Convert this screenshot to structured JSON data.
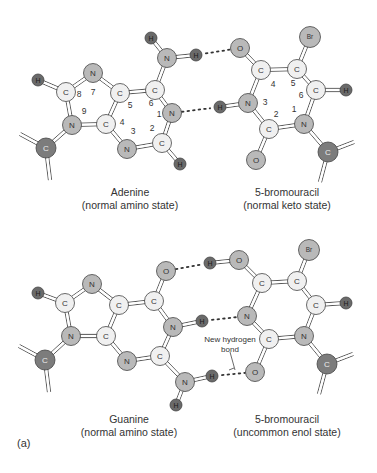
{
  "colors": {
    "carbon": "#f0f0f0",
    "hetero": "#b9b9b9",
    "hydrogen": "#6a6a6a",
    "sugar": "#7c7c7c",
    "bond": "#444444",
    "text": "#333333"
  },
  "top": {
    "left_caption": {
      "name": "Adenine",
      "state": "(normal amino state)"
    },
    "right_caption": {
      "name": "5-bromouracil",
      "state": "(normal keto state)"
    }
  },
  "bottom": {
    "left_caption": {
      "name": "Guanine",
      "state": "(normal amino state)"
    },
    "right_caption": {
      "name": "5-bromouracil",
      "state": "(uncommon enol state)"
    },
    "annotation": {
      "line1": "New hydrogen",
      "line2": "bond"
    }
  },
  "panel_label": "(a)",
  "molecules": [
    {
      "id": "adenine",
      "atoms": [
        {
          "id": "a_H8",
          "el": "H",
          "x": 38,
          "y": 80
        },
        {
          "id": "a_C8",
          "el": "C",
          "x": 66,
          "y": 92
        },
        {
          "id": "a_N7",
          "el": "N",
          "x": 93,
          "y": 73
        },
        {
          "id": "a_C5",
          "el": "C",
          "x": 120,
          "y": 93
        },
        {
          "id": "a_C6",
          "el": "C",
          "x": 155,
          "y": 90
        },
        {
          "id": "a_N6",
          "el": "N",
          "x": 167,
          "y": 58
        },
        {
          "id": "a_H6a",
          "el": "H",
          "x": 151,
          "y": 38
        },
        {
          "id": "a_H6b",
          "el": "H",
          "x": 196,
          "y": 55
        },
        {
          "id": "a_N1",
          "el": "N",
          "x": 172,
          "y": 113
        },
        {
          "id": "a_C2",
          "el": "C",
          "x": 162,
          "y": 143
        },
        {
          "id": "a_H2",
          "el": "H",
          "x": 180,
          "y": 164
        },
        {
          "id": "a_N3",
          "el": "N",
          "x": 127,
          "y": 149
        },
        {
          "id": "a_C4",
          "el": "C",
          "x": 106,
          "y": 124
        },
        {
          "id": "a_N9",
          "el": "N",
          "x": 72,
          "y": 125
        },
        {
          "id": "a_S",
          "el": "C",
          "x": 46,
          "y": 148,
          "sugar": true
        }
      ],
      "numbers": [
        {
          "t": "8",
          "x": 79,
          "y": 97
        },
        {
          "t": "7",
          "x": 93,
          "y": 95
        },
        {
          "t": "9",
          "x": 84,
          "y": 114
        },
        {
          "t": "5",
          "x": 130,
          "y": 108
        },
        {
          "t": "6",
          "x": 151,
          "y": 106
        },
        {
          "t": "1",
          "x": 159,
          "y": 117
        },
        {
          "t": "4",
          "x": 122,
          "y": 125
        },
        {
          "t": "3",
          "x": 133,
          "y": 134
        },
        {
          "t": "2",
          "x": 152,
          "y": 131
        }
      ]
    },
    {
      "id": "bromouracil_keto",
      "atoms": [
        {
          "id": "b_O4",
          "el": "O",
          "x": 240,
          "y": 48
        },
        {
          "id": "b_C4",
          "el": "C",
          "x": 261,
          "y": 70
        },
        {
          "id": "b_C5",
          "el": "C",
          "x": 297,
          "y": 69
        },
        {
          "id": "b_Br",
          "el": "Br",
          "x": 310,
          "y": 37
        },
        {
          "id": "b_C6",
          "el": "C",
          "x": 316,
          "y": 90
        },
        {
          "id": "b_H6",
          "el": "H",
          "x": 346,
          "y": 90
        },
        {
          "id": "b_N3",
          "el": "N",
          "x": 248,
          "y": 103
        },
        {
          "id": "b_H3",
          "el": "H",
          "x": 220,
          "y": 107
        },
        {
          "id": "b_C2",
          "el": "C",
          "x": 269,
          "y": 129
        },
        {
          "id": "b_O2",
          "el": "O",
          "x": 256,
          "y": 160
        },
        {
          "id": "b_N1",
          "el": "N",
          "x": 304,
          "y": 124
        },
        {
          "id": "b_S",
          "el": "C",
          "x": 328,
          "y": 152,
          "sugar": true
        }
      ],
      "numbers": [
        {
          "t": "4",
          "x": 273,
          "y": 87
        },
        {
          "t": "5",
          "x": 293,
          "y": 86
        },
        {
          "t": "6",
          "x": 301,
          "y": 98
        },
        {
          "t": "3",
          "x": 265,
          "y": 105
        },
        {
          "t": "2",
          "x": 276,
          "y": 117
        },
        {
          "t": "1",
          "x": 294,
          "y": 112
        }
      ]
    },
    {
      "id": "guanine",
      "atoms": [
        {
          "id": "g_H8",
          "el": "H",
          "x": 38,
          "y": 293
        },
        {
          "id": "g_C8",
          "el": "C",
          "x": 65,
          "y": 303
        },
        {
          "id": "g_N7",
          "el": "N",
          "x": 92,
          "y": 284
        },
        {
          "id": "g_C5",
          "el": "C",
          "x": 119,
          "y": 305
        },
        {
          "id": "g_C6",
          "el": "C",
          "x": 154,
          "y": 301
        },
        {
          "id": "g_O6",
          "el": "O",
          "x": 166,
          "y": 271
        },
        {
          "id": "g_N1",
          "el": "N",
          "x": 173,
          "y": 327
        },
        {
          "id": "g_H1",
          "el": "H",
          "x": 202,
          "y": 321
        },
        {
          "id": "g_C2",
          "el": "C",
          "x": 160,
          "y": 356
        },
        {
          "id": "g_N2",
          "el": "N",
          "x": 185,
          "y": 382
        },
        {
          "id": "g_H2a",
          "el": "H",
          "x": 212,
          "y": 376
        },
        {
          "id": "g_H2b",
          "el": "H",
          "x": 176,
          "y": 405
        },
        {
          "id": "g_N3",
          "el": "N",
          "x": 127,
          "y": 361
        },
        {
          "id": "g_C4",
          "el": "C",
          "x": 106,
          "y": 336
        },
        {
          "id": "g_N9",
          "el": "N",
          "x": 71,
          "y": 336
        },
        {
          "id": "g_S",
          "el": "C",
          "x": 45,
          "y": 360,
          "sugar": true
        }
      ],
      "numbers": []
    },
    {
      "id": "bromouracil_enol",
      "atoms": [
        {
          "id": "e_H4",
          "el": "H",
          "x": 210,
          "y": 263
        },
        {
          "id": "e_O4",
          "el": "O",
          "x": 239,
          "y": 260
        },
        {
          "id": "e_C4",
          "el": "C",
          "x": 262,
          "y": 283
        },
        {
          "id": "e_C5",
          "el": "C",
          "x": 297,
          "y": 281
        },
        {
          "id": "e_Br",
          "el": "Br",
          "x": 309,
          "y": 250
        },
        {
          "id": "e_C6",
          "el": "C",
          "x": 316,
          "y": 305
        },
        {
          "id": "e_H6",
          "el": "H",
          "x": 346,
          "y": 303
        },
        {
          "id": "e_N3",
          "el": "N",
          "x": 247,
          "y": 316
        },
        {
          "id": "e_C2",
          "el": "C",
          "x": 269,
          "y": 339
        },
        {
          "id": "e_O2",
          "el": "O",
          "x": 255,
          "y": 372
        },
        {
          "id": "e_N1",
          "el": "N",
          "x": 304,
          "y": 336
        },
        {
          "id": "e_S",
          "el": "C",
          "x": 327,
          "y": 364,
          "sugar": true
        }
      ],
      "numbers": []
    }
  ],
  "bonds": [
    [
      "a_H8",
      "a_C8",
      2
    ],
    [
      "a_C8",
      "a_N7",
      2
    ],
    [
      "a_N7",
      "a_C5",
      2
    ],
    [
      "a_C5",
      "a_C6",
      2
    ],
    [
      "a_C6",
      "a_N6",
      2
    ],
    [
      "a_N6",
      "a_H6a",
      2
    ],
    [
      "a_N6",
      "a_H6b",
      2
    ],
    [
      "a_C6",
      "a_N1",
      2
    ],
    [
      "a_N1",
      "a_C2",
      2
    ],
    [
      "a_C2",
      "a_H2",
      2
    ],
    [
      "a_C2",
      "a_N3",
      2
    ],
    [
      "a_N3",
      "a_C4",
      2
    ],
    [
      "a_C4",
      "a_C5",
      2
    ],
    [
      "a_C4",
      "a_N9",
      2
    ],
    [
      "a_N9",
      "a_C8",
      2
    ],
    [
      "a_N9",
      "a_S",
      2
    ],
    [
      "b_O4",
      "b_C4",
      2
    ],
    [
      "b_C4",
      "b_C5",
      2
    ],
    [
      "b_C5",
      "b_Br",
      2
    ],
    [
      "b_C5",
      "b_C6",
      2
    ],
    [
      "b_C6",
      "b_H6",
      2
    ],
    [
      "b_C4",
      "b_N3",
      2
    ],
    [
      "b_N3",
      "b_H3",
      2
    ],
    [
      "b_N3",
      "b_C2",
      2
    ],
    [
      "b_C2",
      "b_O2",
      2
    ],
    [
      "b_C2",
      "b_N1",
      2
    ],
    [
      "b_N1",
      "b_C6",
      2
    ],
    [
      "b_N1",
      "b_S",
      2
    ],
    [
      "g_H8",
      "g_C8",
      2
    ],
    [
      "g_C8",
      "g_N7",
      2
    ],
    [
      "g_N7",
      "g_C5",
      2
    ],
    [
      "g_C5",
      "g_C6",
      2
    ],
    [
      "g_C6",
      "g_O6",
      2
    ],
    [
      "g_C6",
      "g_N1",
      2
    ],
    [
      "g_N1",
      "g_H1",
      2
    ],
    [
      "g_N1",
      "g_C2",
      2
    ],
    [
      "g_C2",
      "g_N2",
      2
    ],
    [
      "g_N2",
      "g_H2a",
      2
    ],
    [
      "g_N2",
      "g_H2b",
      2
    ],
    [
      "g_C2",
      "g_N3",
      2
    ],
    [
      "g_N3",
      "g_C4",
      2
    ],
    [
      "g_C4",
      "g_C5",
      2
    ],
    [
      "g_C4",
      "g_N9",
      2
    ],
    [
      "g_N9",
      "g_C8",
      2
    ],
    [
      "g_N9",
      "g_S",
      2
    ],
    [
      "e_H4",
      "e_O4",
      2
    ],
    [
      "e_O4",
      "e_C4",
      2
    ],
    [
      "e_C4",
      "e_C5",
      2
    ],
    [
      "e_C5",
      "e_Br",
      2
    ],
    [
      "e_C5",
      "e_C6",
      2
    ],
    [
      "e_C6",
      "e_H6",
      2
    ],
    [
      "e_C4",
      "e_N3",
      2
    ],
    [
      "e_N3",
      "e_C2",
      2
    ],
    [
      "e_C2",
      "e_O2",
      2
    ],
    [
      "e_C2",
      "e_N1",
      2
    ],
    [
      "e_N1",
      "e_C6",
      2
    ],
    [
      "e_N1",
      "e_S",
      2
    ]
  ],
  "hbonds": [
    [
      "a_H6b",
      "b_O4"
    ],
    [
      "a_N1",
      "b_H3"
    ],
    [
      "g_O6",
      "e_H4"
    ],
    [
      "g_H1",
      "e_N3"
    ],
    [
      "g_H2a",
      "e_O2"
    ]
  ],
  "sugar_stubs": [
    {
      "from": "a_S",
      "dx": -26,
      "dy": -14
    },
    {
      "from": "a_S",
      "dx": 4,
      "dy": 32
    },
    {
      "from": "b_S",
      "dx": 26,
      "dy": -10
    },
    {
      "from": "b_S",
      "dx": -8,
      "dy": 30
    },
    {
      "from": "g_S",
      "dx": -26,
      "dy": -14
    },
    {
      "from": "g_S",
      "dx": 4,
      "dy": 32
    },
    {
      "from": "e_S",
      "dx": 26,
      "dy": -10
    },
    {
      "from": "e_S",
      "dx": -8,
      "dy": 30
    }
  ]
}
